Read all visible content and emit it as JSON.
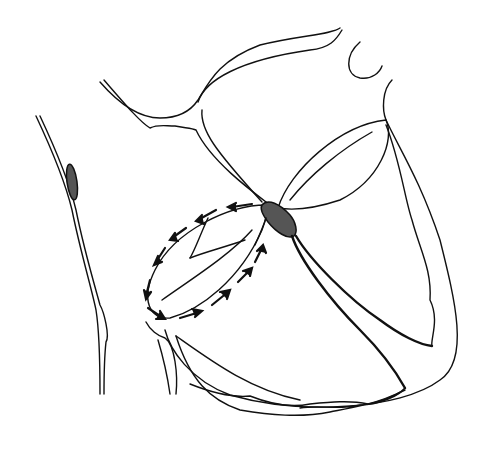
{
  "figure": {
    "background": "#ffffff",
    "stroke_color": "#111111",
    "node_fill": "#555555",
    "elements": [
      {
        "name": "left-vessel",
        "node": "shaded-node-on-vessel"
      },
      {
        "name": "great-vessels"
      },
      {
        "name": "av-node",
        "shaded": true
      },
      {
        "name": "left-valve-chamber",
        "arrows": "circulating"
      },
      {
        "name": "right-valve-chamber"
      },
      {
        "name": "bundle-branches"
      },
      {
        "name": "ventricle-outline"
      }
    ]
  }
}
